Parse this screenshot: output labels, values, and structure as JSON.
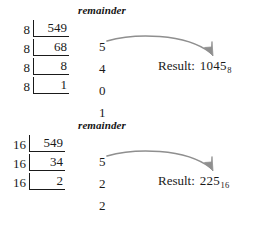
{
  "page": {
    "background": "#ffffff",
    "ink": "#1a1a1a",
    "arrow_color": "#8a8a8a"
  },
  "blocks": [
    {
      "id": "octal",
      "remainder_label": "remainder",
      "divisions": [
        {
          "divisor": "8",
          "dividend": "549"
        },
        {
          "divisor": "8",
          "dividend": "68"
        },
        {
          "divisor": "8",
          "dividend": "8"
        },
        {
          "divisor": "8",
          "dividend": "1"
        }
      ],
      "remainders": [
        "5",
        "4",
        "0",
        "1"
      ],
      "result": {
        "label": "Result:",
        "value": "1045",
        "subscript": "8"
      }
    },
    {
      "id": "hex",
      "remainder_label": "remainder",
      "divisions": [
        {
          "divisor": "16",
          "dividend": "549"
        },
        {
          "divisor": "16",
          "dividend": "34"
        },
        {
          "divisor": "16",
          "dividend": "2"
        }
      ],
      "remainders": [
        "5",
        "2",
        "2"
      ],
      "result": {
        "label": "Result:",
        "value": "225",
        "subscript": "16"
      }
    }
  ]
}
